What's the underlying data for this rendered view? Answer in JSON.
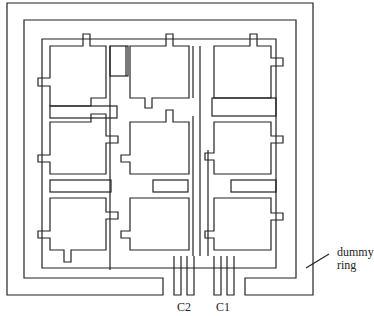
{
  "labels": {
    "c2": "C2",
    "c1": "C1",
    "dummy_ring_line1": "dummy",
    "dummy_ring_line2": "ring"
  },
  "grid": {
    "rows": 3,
    "cols": 3
  },
  "colors": {
    "stroke": "#222222",
    "background": "#ffffff"
  }
}
